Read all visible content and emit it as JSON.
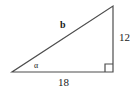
{
  "figure": {
    "type": "right-triangle-diagram",
    "background_color": "#ffffff",
    "stroke_color": "#4d4d4d",
    "text_color": "#1a1a1a"
  },
  "geometry": {
    "vertices": {
      "left": {
        "x": 12,
        "y": 72
      },
      "right_angle": {
        "x": 113,
        "y": 72
      },
      "top": {
        "x": 113,
        "y": 6
      }
    },
    "right_angle_marker": {
      "size": 8,
      "present": true
    }
  },
  "labels": {
    "vertical_leg": "12",
    "horizontal_leg": "18",
    "hypotenuse": "b",
    "angle": "α"
  }
}
